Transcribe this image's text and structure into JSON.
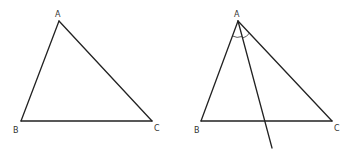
{
  "figures": [
    {
      "id": "triangle-left",
      "vertices": {
        "A": {
          "label": "A",
          "x": 59,
          "y": 21,
          "lx": 55,
          "ly": 17
        },
        "B": {
          "label": "B",
          "x": 21,
          "y": 121,
          "lx": 13,
          "ly": 133
        },
        "C": {
          "label": "C",
          "x": 152,
          "y": 121,
          "lx": 154,
          "ly": 131
        }
      }
    },
    {
      "id": "triangle-right",
      "vertices": {
        "A": {
          "label": "A",
          "x": 238,
          "y": 21,
          "lx": 234,
          "ly": 17
        },
        "B": {
          "label": "B",
          "x": 201,
          "y": 121,
          "lx": 194,
          "ly": 133
        },
        "C": {
          "label": "C",
          "x": 332,
          "y": 121,
          "lx": 334,
          "ly": 131
        }
      },
      "cevian": {
        "from": "A",
        "to": {
          "x": 272,
          "y": 148
        }
      },
      "angle_marks": 2
    }
  ],
  "colors": {
    "stroke": "#222222",
    "label": "#333333",
    "background": "#ffffff"
  }
}
